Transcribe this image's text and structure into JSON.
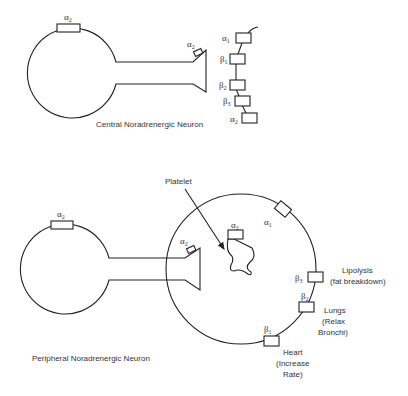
{
  "central_neuron": {
    "label": "Central Noradrenergic Neuron",
    "soma_receptor": {
      "symbol": "α",
      "sub": "2"
    },
    "terminal_receptor": {
      "symbol": "α",
      "sub": "2"
    }
  },
  "receptor_legend": [
    {
      "symbol": "α",
      "sub": "1"
    },
    {
      "symbol": "β",
      "sub": "1"
    },
    {
      "symbol": "β",
      "sub": "2"
    },
    {
      "symbol": "β",
      "sub": "3"
    },
    {
      "symbol": "α",
      "sub": "2"
    }
  ],
  "peripheral_neuron": {
    "label": "Peripheral Noradrenergic Neuron",
    "soma_receptor": {
      "symbol": "α",
      "sub": "2"
    },
    "terminal_receptor": {
      "symbol": "α",
      "sub": "2"
    }
  },
  "target_cell": {
    "platelet_label": "Platelet",
    "platelet_receptor": {
      "symbol": "α",
      "sub": "2"
    },
    "receptors": [
      {
        "symbol": "α",
        "sub": "1",
        "effect": []
      },
      {
        "symbol": "β",
        "sub": "3",
        "effect": [
          "Lipolysis",
          "(fat breakdown)"
        ]
      },
      {
        "symbol": "β",
        "sub": "2",
        "effect": [
          "Lungs",
          "(Relax",
          "Bronchi)"
        ]
      },
      {
        "symbol": "β",
        "sub": "1",
        "effect": [
          "Heart",
          "(Increase",
          "Rate)"
        ]
      }
    ]
  }
}
